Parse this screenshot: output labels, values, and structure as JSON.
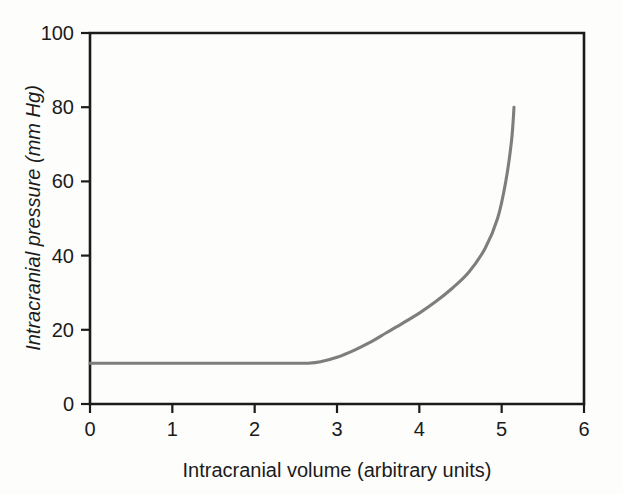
{
  "chart_data": {
    "type": "line",
    "title": "",
    "xlabel": "Intracranial volume (arbitrary units)",
    "ylabel": "Intracranial pressure (mm Hg)",
    "xlim": [
      0,
      6
    ],
    "ylim": [
      0,
      100
    ],
    "xticks": [
      "0",
      "1",
      "2",
      "3",
      "4",
      "5",
      "6"
    ],
    "xtick_values": [
      0,
      1,
      2,
      3,
      4,
      5,
      6
    ],
    "yticks": [
      "0",
      "20",
      "40",
      "60",
      "80",
      "100"
    ],
    "ytick_values": [
      0,
      20,
      40,
      60,
      80,
      100
    ],
    "grid": false,
    "legend": null,
    "series": [
      {
        "name": "Intracranial pressure-volume curve",
        "color": "#7e7e7e",
        "x": [
          0.0,
          0.25,
          0.5,
          0.75,
          1.0,
          1.25,
          1.5,
          1.75,
          2.0,
          2.25,
          2.5,
          2.65,
          2.8,
          3.0,
          3.2,
          3.4,
          3.6,
          3.8,
          4.0,
          4.2,
          4.4,
          4.6,
          4.8,
          4.95,
          5.05,
          5.12,
          5.15
        ],
        "y": [
          11.0,
          11.0,
          11.0,
          11.0,
          11.0,
          11.0,
          11.0,
          11.0,
          11.0,
          11.0,
          11.0,
          11.0,
          11.4,
          12.6,
          14.4,
          16.6,
          19.2,
          21.8,
          24.5,
          27.6,
          31.2,
          35.5,
          42.0,
          50.0,
          60.0,
          71.0,
          80.0
        ]
      }
    ],
    "annotations": []
  },
  "style": {
    "background": "#fdfdfb",
    "axis_color": "#1b1b1b",
    "curve_color": "#7e7e7e"
  },
  "geometry": {
    "x0_px": 90,
    "x1_px": 584,
    "y0_px": 404,
    "y1_px": 33
  }
}
